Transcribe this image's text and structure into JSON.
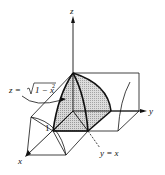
{
  "figure": {
    "type": "3d-region-diagram",
    "axes": {
      "x_label": "x",
      "y_label": "y",
      "z_label": "z"
    },
    "annotations": {
      "surface_eq_lhs": "z = ",
      "surface_eq_rad": "1 − x",
      "surface_eq_exp": "2",
      "plane_eq": "y = x",
      "tick_one": "1"
    },
    "colors": {
      "line": "#111111",
      "shade": "#c8c8c8",
      "background": "#ffffff"
    }
  }
}
